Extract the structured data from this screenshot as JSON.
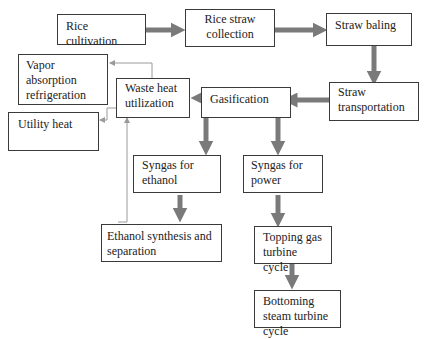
{
  "diagram": {
    "nodes": [
      {
        "id": "rice_cultivation",
        "label": "Rice cultivation"
      },
      {
        "id": "rice_straw_collection",
        "label": "Rice straw collection"
      },
      {
        "id": "straw_baling",
        "label": "Straw baling"
      },
      {
        "id": "straw_transportation",
        "label": "Straw transportation"
      },
      {
        "id": "gasification",
        "label": "Gasification"
      },
      {
        "id": "waste_heat_utilization",
        "label": "Waste heat utilization"
      },
      {
        "id": "vapor_absorption_refrigeration",
        "label": "Vapor absorption refrigeration"
      },
      {
        "id": "utility_heat",
        "label": "Utility heat"
      },
      {
        "id": "syngas_for_ethanol",
        "label": "Syngas for ethanol"
      },
      {
        "id": "syngas_for_power",
        "label": "Syngas for power"
      },
      {
        "id": "ethanol_synthesis",
        "label": "Ethanol synthesis and separation"
      },
      {
        "id": "topping_gas_turbine",
        "label": "Topping gas turbine cycle"
      },
      {
        "id": "bottoming_steam_turbine",
        "label": "Bottoming steam turbine cycle"
      }
    ],
    "edges": [
      {
        "from": "rice_cultivation",
        "to": "rice_straw_collection",
        "style": "thick"
      },
      {
        "from": "rice_straw_collection",
        "to": "straw_baling",
        "style": "thick"
      },
      {
        "from": "straw_baling",
        "to": "straw_transportation",
        "style": "thick"
      },
      {
        "from": "straw_transportation",
        "to": "gasification",
        "style": "thick"
      },
      {
        "from": "gasification",
        "to": "waste_heat_utilization",
        "style": "thick"
      },
      {
        "from": "gasification",
        "to": "syngas_for_ethanol",
        "style": "thick"
      },
      {
        "from": "gasification",
        "to": "syngas_for_power",
        "style": "thick"
      },
      {
        "from": "syngas_for_ethanol",
        "to": "ethanol_synthesis",
        "style": "thick"
      },
      {
        "from": "syngas_for_power",
        "to": "topping_gas_turbine",
        "style": "thick"
      },
      {
        "from": "topping_gas_turbine",
        "to": "bottoming_steam_turbine",
        "style": "thick"
      },
      {
        "from": "waste_heat_utilization",
        "to": "vapor_absorption_refrigeration",
        "style": "thin"
      },
      {
        "from": "waste_heat_utilization",
        "to": "utility_heat",
        "style": "thin"
      },
      {
        "from": "ethanol_synthesis",
        "to": "waste_heat_utilization",
        "style": "thin"
      }
    ],
    "colors": {
      "thick_arrow": "#7a7a7a",
      "thin_arrow": "#9a9a9a",
      "border": "#3a3a3a"
    }
  }
}
